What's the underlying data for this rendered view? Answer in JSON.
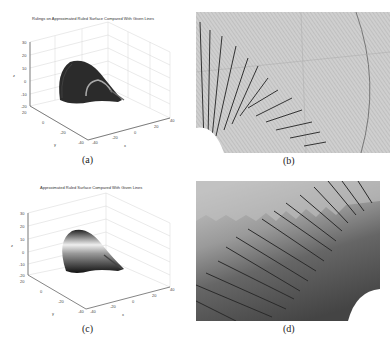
{
  "figures": [
    {
      "id": "a",
      "caption": "(a)",
      "title": "Rulings on Approximated Ruled Surface Compared With Given Lines",
      "axes": {
        "xlabel": "x",
        "ylabel": "y",
        "zlabel": "z",
        "z_ticks": [
          "30",
          "20",
          "10",
          "0",
          "-10",
          "-20"
        ],
        "y_ticks": [
          "20",
          "0",
          "-20",
          "-40"
        ],
        "x_ticks": [
          "-40",
          "-20",
          "0",
          "20",
          "40"
        ]
      }
    },
    {
      "id": "b",
      "caption": "(b)"
    },
    {
      "id": "c",
      "caption": "(c)",
      "title": "Approximated Ruled Surface Compared With Given Lines",
      "axes": {
        "xlabel": "x",
        "ylabel": "y",
        "zlabel": "z",
        "z_ticks": [
          "30",
          "20",
          "10",
          "0",
          "-10",
          "-20"
        ],
        "y_ticks": [
          "20",
          "0",
          "-20",
          "-40"
        ],
        "x_ticks": [
          "-40",
          "-20",
          "0",
          "20",
          "40"
        ]
      }
    },
    {
      "id": "d",
      "caption": "(d)"
    }
  ],
  "colors": {
    "surface_dark": "#2a2a2a",
    "grid": "#d0d0d0",
    "zoom_bg": "#bdbdbd"
  }
}
